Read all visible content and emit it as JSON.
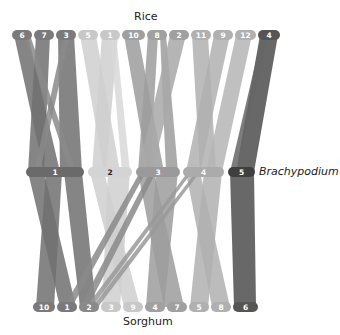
{
  "species": {
    "top": "Rice",
    "middle": "Brachypodium",
    "bottom": "Sorghum"
  },
  "rice_chromosomes": [
    {
      "label": "6",
      "x1": 12,
      "x2": 32,
      "color": "#7a7a7a"
    },
    {
      "label": "7",
      "x1": 34,
      "x2": 54,
      "color": "#7a7a7a"
    },
    {
      "label": "3",
      "x1": 56,
      "x2": 76,
      "color": "#7a7a7a"
    },
    {
      "label": "5",
      "x1": 78,
      "x2": 98,
      "color": "#c8c8c8"
    },
    {
      "label": "1",
      "x1": 100,
      "x2": 120,
      "color": "#c8c8c8"
    },
    {
      "label": "10",
      "x1": 122,
      "x2": 145,
      "color": "#a0a0a0"
    },
    {
      "label": "8",
      "x1": 147,
      "x2": 167,
      "color": "#a0a0a0"
    },
    {
      "label": "2",
      "x1": 169,
      "x2": 189,
      "color": "#a0a0a0"
    },
    {
      "label": "11",
      "x1": 191,
      "x2": 211,
      "color": "#b0b0b0"
    },
    {
      "label": "9",
      "x1": 213,
      "x2": 233,
      "color": "#b0b0b0"
    },
    {
      "label": "12",
      "x1": 235,
      "x2": 256,
      "color": "#b0b0b0"
    },
    {
      "label": "4",
      "x1": 258,
      "x2": 280,
      "color": "#555555"
    }
  ],
  "brachypodium_chromosomes": [
    {
      "label": "1",
      "x1": 26,
      "x2": 84,
      "color": "#6a6a6a"
    },
    {
      "label": "2",
      "x1": 88,
      "x2": 132,
      "color": "#d4d4d4"
    },
    {
      "label": "3",
      "x1": 136,
      "x2": 180,
      "color": "#9a9a9a"
    },
    {
      "label": "4",
      "x1": 183,
      "x2": 224,
      "color": "#ababab"
    },
    {
      "label": "5",
      "x1": 228,
      "x2": 255,
      "color": "#3f3f3f"
    }
  ],
  "sorghum_chromosomes": [
    {
      "label": "10",
      "x1": 33,
      "x2": 55,
      "color": "#7a7a7a"
    },
    {
      "label": "1",
      "x1": 57,
      "x2": 77,
      "color": "#7a7a7a"
    },
    {
      "label": "2",
      "x1": 79,
      "x2": 99,
      "color": "#8a8a8a"
    },
    {
      "label": "3",
      "x1": 101,
      "x2": 121,
      "color": "#c8c8c8"
    },
    {
      "label": "9",
      "x1": 123,
      "x2": 143,
      "color": "#c8c8c8"
    },
    {
      "label": "4",
      "x1": 145,
      "x2": 165,
      "color": "#a0a0a0"
    },
    {
      "label": "7",
      "x1": 167,
      "x2": 187,
      "color": "#a0a0a0"
    },
    {
      "label": "5",
      "x1": 189,
      "x2": 209,
      "color": "#b0b0b0"
    },
    {
      "label": "8",
      "x1": 211,
      "x2": 231,
      "color": "#b0b0b0"
    },
    {
      "label": "6",
      "x1": 233,
      "x2": 258,
      "color": "#555555"
    }
  ],
  "top_ribbons": [
    {
      "rx1": 14,
      "rx2": 28,
      "bx1": 44,
      "bx2": 60,
      "color": "#707070"
    },
    {
      "rx1": 36,
      "rx2": 50,
      "bx1": 28,
      "bx2": 44,
      "color": "#707070"
    },
    {
      "rx1": 58,
      "rx2": 74,
      "bx1": 60,
      "bx2": 82,
      "color": "#707070"
    },
    {
      "rx1": 24,
      "rx2": 30,
      "bx1": 70,
      "bx2": 76,
      "color": "#8a8a8a"
    },
    {
      "rx1": 64,
      "rx2": 70,
      "bx1": 34,
      "bx2": 40,
      "color": "#8a8a8a"
    },
    {
      "rx1": 80,
      "rx2": 96,
      "bx1": 104,
      "bx2": 120,
      "color": "#cfcfcf"
    },
    {
      "rx1": 102,
      "rx2": 118,
      "bx1": 92,
      "bx2": 106,
      "color": "#cfcfcf"
    },
    {
      "rx1": 110,
      "rx2": 116,
      "bx1": 122,
      "bx2": 130,
      "color": "#d8d8d8"
    },
    {
      "rx1": 124,
      "rx2": 138,
      "bx1": 148,
      "bx2": 164,
      "color": "#9c9c9c"
    },
    {
      "rx1": 148,
      "rx2": 158,
      "bx1": 138,
      "bx2": 150,
      "color": "#9c9c9c"
    },
    {
      "rx1": 160,
      "rx2": 166,
      "bx1": 166,
      "bx2": 178,
      "color": "#9c9c9c"
    },
    {
      "rx1": 170,
      "rx2": 186,
      "bx1": 138,
      "bx2": 152,
      "color": "#a8a8a8"
    },
    {
      "rx1": 192,
      "rx2": 208,
      "bx1": 200,
      "bx2": 216,
      "color": "#b0b0b0"
    },
    {
      "rx1": 214,
      "rx2": 230,
      "bx1": 186,
      "bx2": 200,
      "color": "#b0b0b0"
    },
    {
      "rx1": 236,
      "rx2": 252,
      "bx1": 206,
      "bx2": 222,
      "color": "#b5b5b5"
    },
    {
      "rx1": 260,
      "rx2": 278,
      "bx1": 236,
      "bx2": 254,
      "color": "#4e4e4e"
    },
    {
      "rx1": 262,
      "rx2": 268,
      "bx1": 230,
      "bx2": 236,
      "color": "#666666"
    }
  ],
  "bottom_ribbons": [
    {
      "bx1": 28,
      "bx2": 44,
      "sx1": 60,
      "sx2": 76,
      "color": "#707070"
    },
    {
      "bx1": 46,
      "bx2": 62,
      "sx1": 36,
      "sx2": 54,
      "color": "#707070"
    },
    {
      "bx1": 64,
      "bx2": 82,
      "sx1": 80,
      "sx2": 96,
      "color": "#707070"
    },
    {
      "bx1": 90,
      "bx2": 104,
      "sx1": 124,
      "sx2": 140,
      "color": "#cfcfcf"
    },
    {
      "bx1": 108,
      "bx2": 130,
      "sx1": 102,
      "sx2": 120,
      "color": "#cfcfcf"
    },
    {
      "bx1": 138,
      "bx2": 154,
      "sx1": 164,
      "sx2": 184,
      "color": "#9c9c9c"
    },
    {
      "bx1": 156,
      "bx2": 178,
      "sx1": 146,
      "sx2": 164,
      "color": "#9c9c9c"
    },
    {
      "bx1": 140,
      "bx2": 146,
      "sx1": 64,
      "sx2": 72,
      "color": "#8a8a8a"
    },
    {
      "bx1": 150,
      "bx2": 156,
      "sx1": 80,
      "sx2": 88,
      "color": "#8a8a8a"
    },
    {
      "bx1": 186,
      "bx2": 200,
      "sx1": 212,
      "sx2": 230,
      "color": "#b0b0b0"
    },
    {
      "bx1": 204,
      "bx2": 222,
      "sx1": 190,
      "sx2": 208,
      "color": "#b0b0b0"
    },
    {
      "bx1": 188,
      "bx2": 192,
      "sx1": 86,
      "sx2": 92,
      "color": "#999999"
    },
    {
      "bx1": 196,
      "bx2": 200,
      "sx1": 92,
      "sx2": 98,
      "color": "#999999"
    },
    {
      "bx1": 230,
      "bx2": 254,
      "sx1": 234,
      "sx2": 256,
      "color": "#4e4e4e"
    }
  ]
}
